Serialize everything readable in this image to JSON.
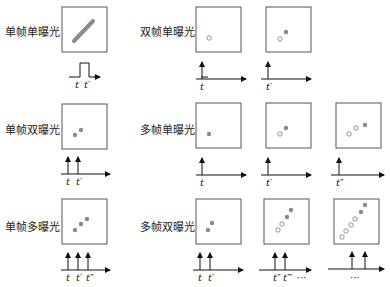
{
  "labels": {
    "r1c1": "单帧单曝光",
    "r1c2": "双帧单曝光",
    "r2c1": "单帧双曝光",
    "r2c2": "多帧单曝光",
    "r3c1": "单帧多曝光",
    "r3c2": "多帧双曝光"
  },
  "time_labels": {
    "t": "t",
    "t1": "t′",
    "t2": "t″",
    "t3": "t‴",
    "ellipsis": "···"
  },
  "colors": {
    "filled_dot": "#8a8a8a",
    "line": "#111111",
    "box": "#555555"
  },
  "panels": [
    {
      "id": "single-frame-single-exposure",
      "label": "单帧单曝光",
      "frames": 1,
      "exposure": "pulse",
      "times": [
        "t",
        "t′"
      ]
    },
    {
      "id": "double-frame-single-exposure-1",
      "label": "双帧单曝光",
      "dots": [
        {
          "type": "hollow"
        }
      ],
      "times": [
        "t"
      ]
    },
    {
      "id": "double-frame-single-exposure-2",
      "dots": [
        {
          "type": "hollow"
        },
        {
          "type": "filled"
        }
      ],
      "times": [
        "t′"
      ]
    },
    {
      "id": "single-frame-double-exposure",
      "label": "单帧双曝光",
      "dots": [
        {
          "type": "filled"
        },
        {
          "type": "filled"
        }
      ],
      "times": [
        "t",
        "t′"
      ]
    },
    {
      "id": "multi-frame-single-exposure-1",
      "label": "多帧单曝光",
      "dots": [
        {
          "type": "filled"
        }
      ],
      "times": [
        "t"
      ]
    },
    {
      "id": "multi-frame-single-exposure-2",
      "dots": [
        {
          "type": "hollow"
        },
        {
          "type": "filled"
        }
      ],
      "times": [
        "t′"
      ]
    },
    {
      "id": "multi-frame-single-exposure-3",
      "dots": [
        {
          "type": "hollow"
        },
        {
          "type": "hollow"
        },
        {
          "type": "filled"
        }
      ],
      "times": [
        "t″"
      ]
    },
    {
      "id": "single-frame-multi-exposure",
      "label": "单帧多曝光",
      "dots": [
        {
          "type": "filled"
        },
        {
          "type": "filled"
        },
        {
          "type": "filled"
        }
      ],
      "times": [
        "t",
        "t′",
        "t″"
      ]
    },
    {
      "id": "multi-frame-double-exposure-1",
      "label": "多帧双曝光",
      "dots": [
        {
          "type": "filled"
        },
        {
          "type": "filled"
        }
      ],
      "times": [
        "t",
        "t′"
      ]
    },
    {
      "id": "multi-frame-double-exposure-2",
      "dots": [
        {
          "type": "hollow"
        },
        {
          "type": "hollow"
        },
        {
          "type": "filled"
        },
        {
          "type": "filled"
        }
      ],
      "times": [
        "t″",
        "t‴",
        "···"
      ]
    },
    {
      "id": "multi-frame-double-exposure-3",
      "dots": [
        {
          "type": "hollow"
        },
        {
          "type": "hollow"
        },
        {
          "type": "hollow"
        },
        {
          "type": "hollow"
        },
        {
          "type": "filled"
        },
        {
          "type": "filled"
        }
      ],
      "times": [
        "···"
      ]
    }
  ]
}
